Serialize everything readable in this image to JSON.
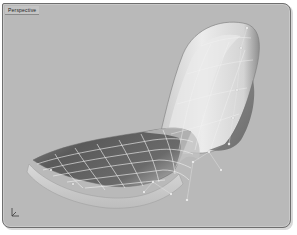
{
  "viewport": {
    "title": "Perspective",
    "background": "#b9b9b9",
    "border_color": "#6e6e6e"
  },
  "model": {
    "description": "curved lounge chair surface",
    "surface_dark": "#585858",
    "surface_light": "#e6e6e6",
    "isocurve_color": "#f2f2f2"
  },
  "icons": {
    "axis": "world-axis-icon"
  }
}
